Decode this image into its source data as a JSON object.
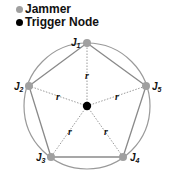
{
  "legend": {
    "items": [
      {
        "label": "Jammer",
        "color": "#a0a0a0"
      },
      {
        "label": "Trigger Node",
        "color": "#000000"
      }
    ]
  },
  "diagram": {
    "center": {
      "x": 87,
      "y": 106
    },
    "radius": 63,
    "circle_color": "#9a9a9a",
    "pentagon_color": "#8a8a8a",
    "spoke_color": "#9a9a9a",
    "jammer_color": "#a0a0a0",
    "trigger_color": "#000000",
    "jammers": [
      {
        "id": "J1",
        "letter": "J",
        "sub": "1",
        "x": 87,
        "y": 43
      },
      {
        "id": "J2",
        "letter": "J",
        "sub": "2",
        "x": 29,
        "y": 86
      },
      {
        "id": "J3",
        "letter": "J",
        "sub": "3",
        "x": 51,
        "y": 157
      },
      {
        "id": "J4",
        "letter": "J",
        "sub": "4",
        "x": 123,
        "y": 157
      },
      {
        "id": "J5",
        "letter": "J",
        "sub": "5",
        "x": 146,
        "y": 86
      }
    ],
    "spoke_label": "r"
  }
}
